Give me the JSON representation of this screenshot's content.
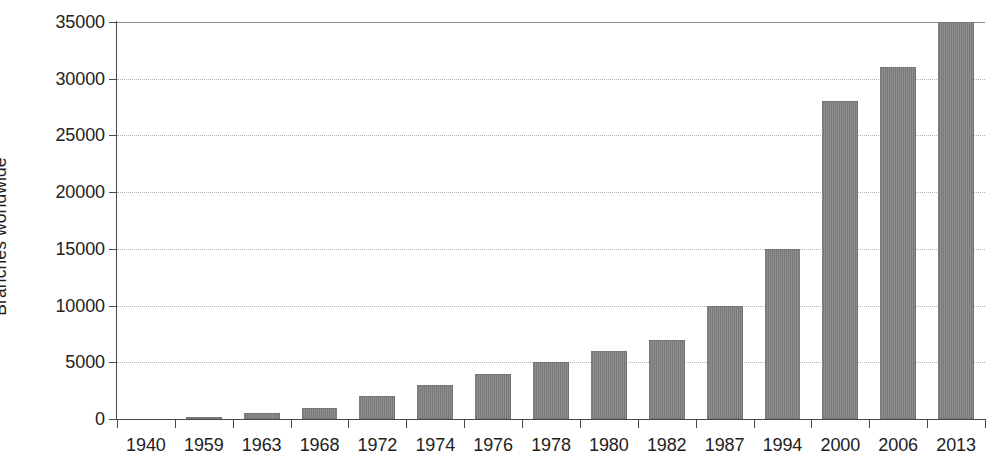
{
  "chart_data": {
    "type": "bar",
    "title": "",
    "subtitle": "",
    "xlabel": "",
    "ylabel": "Branches worldwide",
    "categories": [
      "1940",
      "1959",
      "1963",
      "1968",
      "1972",
      "1974",
      "1976",
      "1978",
      "1980",
      "1982",
      "1987",
      "1994",
      "2000",
      "2006",
      "2013"
    ],
    "values": [
      0,
      150,
      500,
      1000,
      2000,
      3000,
      4000,
      5000,
      6000,
      7000,
      10000,
      15000,
      28000,
      31000,
      35000
    ],
    "ylim": [
      0,
      35000
    ],
    "ytick_values": [
      0,
      5000,
      10000,
      15000,
      20000,
      25000,
      30000,
      35000
    ],
    "ytick_labels": [
      "0",
      "5000",
      "10000",
      "15000",
      "20000",
      "25000",
      "30000",
      "35000"
    ],
    "grid": true,
    "grid_axis": "y",
    "legend": false,
    "legend_position": "none",
    "bar_color": "#808080",
    "grid_color": "#b4b4b4",
    "axis_color": "#4a4a4a",
    "background_color": "#ffffff",
    "text_color": "#222222"
  }
}
